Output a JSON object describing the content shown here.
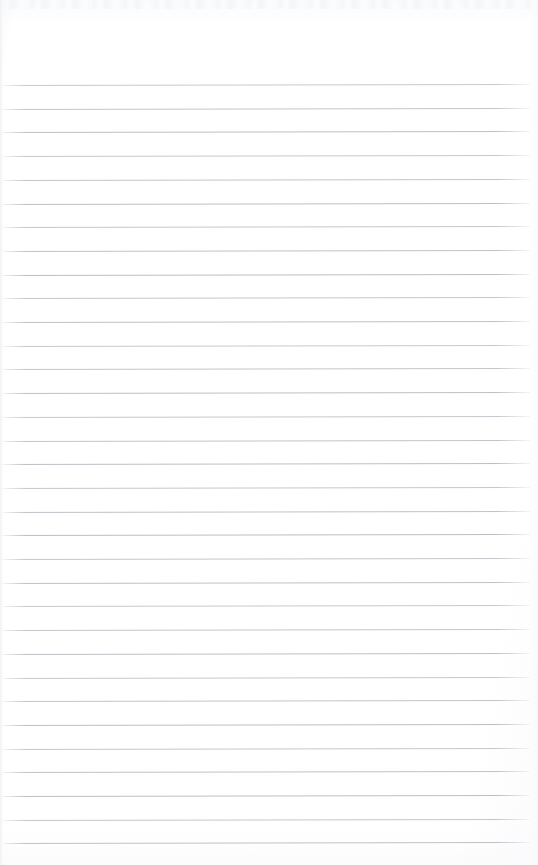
{
  "document": {
    "kind": "scanned-ruled-notebook-page",
    "page_width_px": 538,
    "page_height_px": 865,
    "background_color": "#ffffff",
    "text_content": "",
    "has_handwriting": false,
    "has_printed_text": false,
    "orientation": "portrait"
  },
  "ruling": {
    "line_color": "#b9bdc2",
    "line_thickness_px": 1,
    "line_count": 33,
    "first_line_y_px": 85,
    "line_spacing_px": 23.7,
    "line_start_x_px": 0,
    "line_end_x_px": 530,
    "right_margin_px": 8,
    "slant_degrees": -0.12,
    "lines_y_px": [
      85,
      108.7,
      132.4,
      156.1,
      179.8,
      203.5,
      227.2,
      250.9,
      274.6,
      298.3,
      322,
      345.7,
      369.4,
      393.1,
      416.8,
      440.5,
      464.2,
      487.9,
      511.6,
      535.3,
      559,
      582.7,
      606.4,
      630.1,
      653.8,
      677.5,
      701.2,
      724.9,
      748.6,
      772.3,
      796,
      819.7,
      843.4
    ]
  },
  "margins": {
    "header_blank_height_px": 84,
    "footer_blank_height_px": 10,
    "header_label": "",
    "footer_label": ""
  },
  "scan_artifacts": {
    "top_noise_band_height_px": 9,
    "left_edge_streak_width_px": 5,
    "right_edge_shade_width_px": 8,
    "vignette": "subtle",
    "paper_tone": "#fafbfc"
  }
}
